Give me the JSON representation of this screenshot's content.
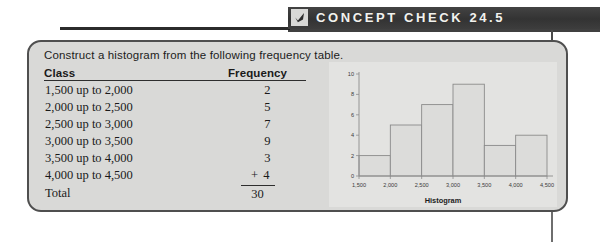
{
  "header": {
    "title": "CONCEPT CHECK 24.5",
    "icon": "checkmark-icon"
  },
  "panel": {
    "prompt": "Construct a histogram from the following frequency table."
  },
  "table": {
    "columns": [
      "Class",
      "Frequency"
    ],
    "rows": [
      {
        "class": "1,500 up to 2,000",
        "frequency": "2"
      },
      {
        "class": "2,000 up to 2,500",
        "frequency": "5"
      },
      {
        "class": "2,500 up to 3,000",
        "frequency": "7"
      },
      {
        "class": "3,000 up to 3,500",
        "frequency": "9"
      },
      {
        "class": "3,500 up to 4,000",
        "frequency": "3"
      },
      {
        "class": "4,000 up to 4,500",
        "frequency": "+ 4"
      }
    ],
    "total_label": "Total",
    "total_value": "30"
  },
  "chart_data": {
    "type": "bar",
    "title": "",
    "xlabel": "Histogram",
    "ylabel": "",
    "categories": [
      "1,500 up to 2,000",
      "2,000 up to 2,500",
      "2,500 up to 3,000",
      "3,000 up to 3,500",
      "3,500 up to 4,000",
      "4,000 up to 4,500"
    ],
    "bin_edges": [
      1500,
      2000,
      2500,
      3000,
      3500,
      4000,
      4500
    ],
    "values": [
      2,
      5,
      7,
      9,
      3,
      4
    ],
    "xticks": [
      "1,500",
      "2,000",
      "2,500",
      "3,000",
      "3,500",
      "4,000",
      "4,500"
    ],
    "yticks": [
      "0",
      "2",
      "4",
      "6",
      "8",
      "10"
    ],
    "ylim": [
      0,
      10
    ],
    "xlim": [
      1500,
      4500
    ],
    "grid": false,
    "legend": null
  },
  "colors": {
    "banner": "#3a3a3a",
    "banner_text": "#f2f2ee",
    "panel_bg": "#d9d9d7",
    "panel_border": "#4f4f4f",
    "bar_outline": "#8a8a8a",
    "plot_bg": "#e3e3e1"
  }
}
